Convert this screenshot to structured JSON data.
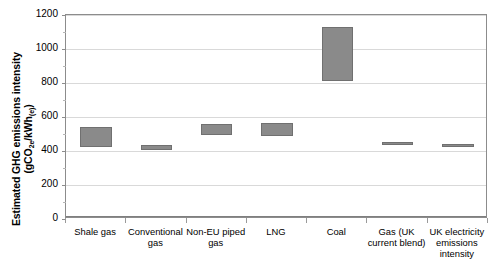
{
  "chart_data": {
    "type": "bar",
    "bar_style": "floating-range",
    "title": "",
    "xlabel": "",
    "ylabel": "Estimated GHG emissions intensity (gCO2e/kWh(e))",
    "ylabel_line1": "Estimated GHG emissions intensity",
    "ylabel_line2_prefix": "(gCO",
    "ylabel_line2_sub1": "2e",
    "ylabel_line2_mid": "/kWh",
    "ylabel_line2_sub2": "(e)",
    "ylabel_line2_suffix": ")",
    "ylim": [
      0,
      1200
    ],
    "ytick_labels": [
      "0",
      "200",
      "400",
      "600",
      "800",
      "1000",
      "1200"
    ],
    "ytick_values": [
      0,
      200,
      400,
      600,
      800,
      1000,
      1200
    ],
    "ytick_step": 200,
    "minor_tick_step": 100,
    "grid": true,
    "grid_axis": "y",
    "legend": "none",
    "categories": [
      "Shale gas",
      "Conventional gas",
      "Non-EU piped gas",
      "LNG",
      "Coal",
      "Gas (UK current blend)",
      "UK electricity emissions intensity"
    ],
    "series": [
      {
        "name": "Estimated GHG emissions intensity range",
        "low": [
          423,
          406,
          494,
          490,
          812,
          441,
          429
        ],
        "high": [
          541,
          435,
          559,
          565,
          1129,
          452,
          440
        ]
      }
    ],
    "bar_color": "#8a8a8a",
    "bar_edge_color": "#707070",
    "grid_color": "#d9d9d9",
    "axis_color": "#8c8c8c"
  },
  "figure": {
    "width": 500,
    "height": 268,
    "background": "#ffffff"
  }
}
